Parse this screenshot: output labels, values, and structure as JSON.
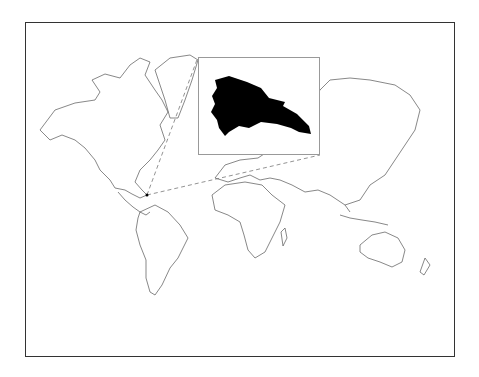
{
  "map": {
    "type": "world-outline-map",
    "projection": "mercator",
    "highlighted_region": "Dominican Republic",
    "highlight_fill": "#000000",
    "coastline_color": "#555555",
    "frame_color": "#333333",
    "connector_style": "dashed",
    "inset": {
      "label": "Dominican Republic inset",
      "border_color": "#999999"
    }
  }
}
